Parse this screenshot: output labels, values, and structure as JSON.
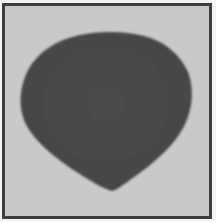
{
  "image": {
    "subject": "dark rounded teardrop-shaped object on light gray background",
    "colors": {
      "background": "#c9c9c9",
      "object": "#4a4a4a",
      "border": "#3e3e3e"
    }
  }
}
